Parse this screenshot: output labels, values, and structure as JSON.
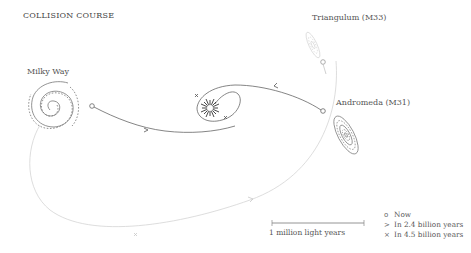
{
  "title": "COLLISION COURSE",
  "galaxies": {
    "milky_way": {
      "label": "Milky Way"
    },
    "andromeda": {
      "label": "Andromeda (M31)"
    },
    "triangulum": {
      "label": "Triangulum (M33)"
    }
  },
  "scale_bar": {
    "label": "1 million light years"
  },
  "legend": {
    "items": [
      {
        "symbol": "o",
        "icon": "circle-icon",
        "label": "Now"
      },
      {
        "symbol": ">",
        "icon": "chevron-icon",
        "label": "In 2.4 billion years"
      },
      {
        "symbol": "×",
        "icon": "cross-icon",
        "label": "In 4.5 billion years"
      }
    ]
  },
  "colors": {
    "line": "#777777",
    "faint_line": "#cccccc",
    "text": "#555555"
  }
}
